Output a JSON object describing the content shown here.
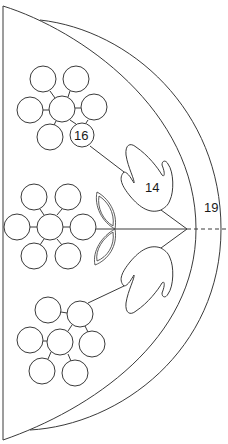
{
  "diagram": {
    "labels": {
      "bead_callout": "16",
      "leaf_callout": "14",
      "rim_callout": "19"
    },
    "colors": {
      "stroke": "#3a3a3a",
      "background": "#ffffff"
    },
    "clusters": [
      {
        "name": "top",
        "circles": [
          [
            43,
            79
          ],
          [
            76,
            79
          ],
          [
            30,
            110
          ],
          [
            62,
            109
          ],
          [
            94,
            107
          ],
          [
            50,
            137
          ],
          [
            82,
            135
          ]
        ]
      },
      {
        "name": "middle",
        "circles": [
          [
            34,
            197
          ],
          [
            68,
            197
          ],
          [
            17,
            227
          ],
          [
            50,
            227
          ],
          [
            83,
            227
          ],
          [
            34,
            256
          ],
          [
            68,
            256
          ]
        ]
      },
      {
        "name": "bottom",
        "circles": [
          [
            48,
            310
          ],
          [
            80,
            314
          ],
          [
            30,
            340
          ],
          [
            60,
            342
          ],
          [
            92,
            344
          ],
          [
            42,
            371
          ],
          [
            75,
            373
          ]
        ]
      }
    ],
    "bead_radius": 13
  }
}
